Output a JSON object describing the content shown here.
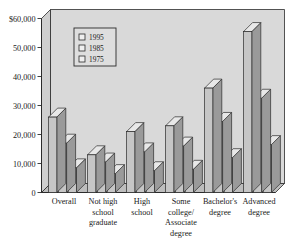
{
  "chart_data": {
    "type": "bar",
    "title": "",
    "subtitle": "",
    "xlabel": "",
    "ylabel": "",
    "ylim": [
      0,
      60000
    ],
    "grid": false,
    "legend_position": "top-left-inside",
    "y_ticks": [
      0,
      10000,
      20000,
      30000,
      40000,
      50000,
      60000
    ],
    "y_tick_labels": [
      "0",
      "10,000",
      "20,000",
      "30,000",
      "40,000",
      "50,000",
      "$60,000"
    ],
    "categories": [
      "Overall",
      "Not high school graduate",
      "High school",
      "Some college/ Associate degree",
      "Bachelor's degree",
      "Advanced degree"
    ],
    "category_label_lines": [
      [
        "Overall"
      ],
      [
        "Not high",
        "school",
        "graduate"
      ],
      [
        "High",
        "school"
      ],
      [
        "Some",
        "college/",
        "Associate",
        "degree"
      ],
      [
        "Bachelor's",
        "degree"
      ],
      [
        "Advanced",
        "degree"
      ]
    ],
    "series": [
      {
        "name": "1995",
        "values": [
          26000,
          13000,
          21000,
          23000,
          36000,
          55500
        ]
      },
      {
        "name": "1985",
        "values": [
          17000,
          10500,
          14000,
          16000,
          24500,
          32500
        ]
      },
      {
        "name": "1975",
        "values": [
          8500,
          6500,
          7500,
          8000,
          12000,
          16500
        ]
      }
    ],
    "colors": {
      "plot_background": "#d9d9d9",
      "bar_front": "#c6c6c6",
      "bar_top": "#e8e8e8",
      "bar_side": "#9a9a9a",
      "outline": "#2b2b2b",
      "text": "#1a1a1a",
      "legend_background": "#dedede",
      "legend_swatch": "#efefef"
    }
  }
}
